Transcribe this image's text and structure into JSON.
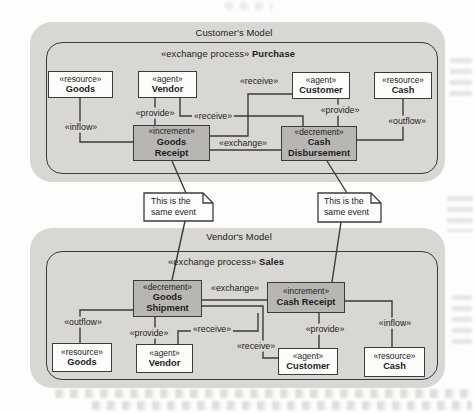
{
  "diagram_type": "REA exchange process diagram (scanned book figure)",
  "colors": {
    "container_bg": "#d8d7d3",
    "entity_box_bg": "#fcfcfa",
    "event_box_bg": "#b7b6b2",
    "line": "#3b3b3b",
    "text": "#1c1c1c"
  },
  "customer_model": {
    "title": "Customer's Model",
    "process": {
      "stereotype": "«exchange process»",
      "name": "Purchase"
    },
    "boxes": {
      "goods": {
        "stereotype": "«resource»",
        "name": "Goods"
      },
      "vendor": {
        "stereotype": "«agent»",
        "name": "Vendor"
      },
      "customer": {
        "stereotype": "«agent»",
        "name": "Customer"
      },
      "cash": {
        "stereotype": "«resource»",
        "name": "Cash"
      },
      "goods_receipt": {
        "stereotype": "«increment»",
        "line1": "Goods",
        "line2": "Receipt"
      },
      "cash_disbursement": {
        "stereotype": "«decrement»",
        "line1": "Cash",
        "line2": "Disbursement"
      }
    },
    "labels": {
      "inflow": "«inflow»",
      "provide_left": "«provide»",
      "receive_vendor": "«receive»",
      "receive_customer": "«receive»",
      "provide_right": "«provide»",
      "outflow": "«outflow»",
      "exchange": "«exchange»"
    }
  },
  "vendor_model": {
    "title": "Vendor's Model",
    "process": {
      "stereotype": "«exchange process»",
      "name": "Sales"
    },
    "boxes": {
      "goods_shipment": {
        "stereotype": "«decrement»",
        "line1": "Goods",
        "line2": "Shipment"
      },
      "cash_receipt": {
        "stereotype": "«increment»",
        "name": "Cash Receipt"
      },
      "goods": {
        "stereotype": "«resource»",
        "name": "Goods"
      },
      "vendor": {
        "stereotype": "«agent»",
        "name": "Vendor"
      },
      "customer": {
        "stereotype": "«agent»",
        "name": "Customer"
      },
      "cash": {
        "stereotype": "«resource»",
        "name": "Cash"
      }
    },
    "labels": {
      "outflow": "«outflow»",
      "provide_left": "«provide»",
      "receive_upper": "«receive»",
      "receive_lower": "«receive»",
      "provide_right": "«provide»",
      "inflow": "«inflow»",
      "exchange": "«exchange»"
    }
  },
  "notes": {
    "left": {
      "line1": "This is the",
      "line2": "same event"
    },
    "right": {
      "line1": "This is the",
      "line2": "same event"
    }
  }
}
